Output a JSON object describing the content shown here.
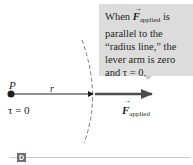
{
  "callout": {
    "line1_prefix": "When ",
    "line1_vector": "F",
    "line1_sub": "applied",
    "line1_suffix": " is",
    "line2": "parallel to the",
    "line3": "“radius line,” the",
    "line4": "lever arm is zero",
    "line5": "and τ = 0."
  },
  "labels": {
    "pivot": "P",
    "radius": "r",
    "torque": "τ = 0",
    "force_vector": "F",
    "force_sub": "applied"
  },
  "panel": {
    "badge": "D"
  },
  "colors": {
    "callout_bg": "#dcdcdc",
    "force_arrow": "#4d4d4f",
    "radius_line": "#231f20",
    "dashed_arc": "#7a7a7a",
    "badge_bg": "#6d6e71"
  }
}
